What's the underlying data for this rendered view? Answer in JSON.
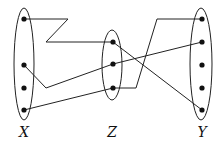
{
  "diagram": {
    "type": "function-composition-mapping",
    "stroke_color": "#222222",
    "sets": [
      {
        "id": "X",
        "label": "X",
        "cx": 24,
        "cy": 64,
        "rx": 10,
        "ry": 56,
        "label_x": 24,
        "label_y": 137,
        "elements": [
          {
            "x": 24,
            "y": 19
          },
          {
            "x": 24,
            "y": 65
          },
          {
            "x": 24,
            "y": 88
          },
          {
            "x": 24,
            "y": 110
          }
        ]
      },
      {
        "id": "Z",
        "label": "Z",
        "cx": 112,
        "cy": 65,
        "rx": 10,
        "ry": 35,
        "label_x": 112,
        "label_y": 137,
        "elements": [
          {
            "x": 113,
            "y": 42
          },
          {
            "x": 113,
            "y": 64
          },
          {
            "x": 113,
            "y": 88
          }
        ]
      },
      {
        "id": "Y",
        "label": "Y",
        "cx": 201,
        "cy": 64,
        "rx": 11,
        "ry": 56,
        "label_x": 202,
        "label_y": 137,
        "elements": [
          {
            "x": 202,
            "y": 19
          },
          {
            "x": 202,
            "y": 42
          },
          {
            "x": 202,
            "y": 65
          },
          {
            "x": 202,
            "y": 88
          },
          {
            "x": 202,
            "y": 110
          }
        ]
      }
    ],
    "edges": [
      {
        "from": "X1",
        "to": "Z1",
        "points": "24,19 68,19 46,42 113,42"
      },
      {
        "from": "X2",
        "to": "Z2",
        "points": "24,65 46,88 113,64"
      },
      {
        "from": "X4",
        "to": "Z3",
        "points": "24,110 113,88"
      },
      {
        "from": "Z1",
        "to": "Y5",
        "points": "113,42 202,110"
      },
      {
        "from": "Z2",
        "to": "Y2",
        "points": "113,64 202,42"
      },
      {
        "from": "Z3",
        "to": "Y1",
        "points": "113,88 136,88 157,19 202,19"
      }
    ]
  }
}
